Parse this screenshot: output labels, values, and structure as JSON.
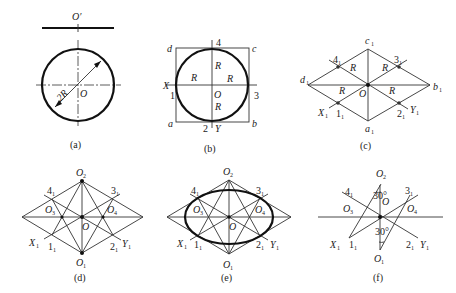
{
  "figure": {
    "panels": [
      {
        "id": "a",
        "caption": "(a)",
        "labels": {
          "top_point": "O′",
          "center": "O",
          "diameter": "2R"
        }
      },
      {
        "id": "b",
        "caption": "(b)",
        "labels": {
          "corners": [
            "a",
            "b",
            "c",
            "d"
          ],
          "points": [
            "1",
            "2",
            "3",
            "4"
          ],
          "axes": [
            "X",
            "Y"
          ],
          "center": "O",
          "radius": "R"
        }
      },
      {
        "id": "c",
        "caption": "(c)",
        "labels": {
          "corners": [
            "a₁",
            "b₁",
            "c₁",
            "d₁"
          ],
          "points": [
            "1₁",
            "2₁",
            "3₁",
            "4₁"
          ],
          "axes": [
            "X₁",
            "Y₁"
          ],
          "center": "O",
          "radius": "R"
        }
      },
      {
        "id": "d",
        "caption": "(d)",
        "labels": {
          "centers": [
            "O₁",
            "O₂",
            "O₃",
            "O₄"
          ],
          "points": [
            "1₁",
            "2₁",
            "3₁",
            "4₁"
          ],
          "axes": [
            "X₁",
            "Y₁"
          ],
          "center": "O"
        }
      },
      {
        "id": "e",
        "caption": "(e)",
        "labels": {
          "centers": [
            "O₁",
            "O₂",
            "O₃",
            "O₄"
          ],
          "points": [
            "1₁",
            "2₁",
            "3₁",
            "4₁"
          ],
          "axes": [
            "X₁",
            "Y₁"
          ],
          "center": "O"
        }
      },
      {
        "id": "f",
        "caption": "(f)",
        "labels": {
          "centers": [
            "O₁",
            "O₂",
            "O₃",
            "O₄"
          ],
          "points": [
            "1₁",
            "2₁",
            "3₁",
            "4₁"
          ],
          "axes": [
            "X₁",
            "Y₁"
          ],
          "center": "O",
          "angle": "30°"
        }
      }
    ]
  },
  "t": {
    "a_Op": "O′",
    "a_O": "O",
    "a_2R": "2R",
    "a_cap": "(a)",
    "b_a": "a",
    "b_b": "b",
    "b_c": "c",
    "b_d": "d",
    "b_1": "1",
    "b_2": "2",
    "b_3": "3",
    "b_4": "4",
    "b_X": "X",
    "b_Y": "Y",
    "b_O": "O",
    "b_R": "R",
    "b_cap": "(b)",
    "c_a": "a",
    "c_b": "b",
    "c_c": "c",
    "c_d": "d",
    "c_1": "1",
    "c_2": "2",
    "c_3": "3",
    "c_4": "4",
    "c_X": "X",
    "c_Y": "Y",
    "c_O": "O",
    "c_R": "R",
    "sub1": "1",
    "sub2": "2",
    "sub3": "3",
    "sub4": "4",
    "c_cap": "(c)",
    "O": "O",
    "d_cap": "(d)",
    "e_cap": "(e)",
    "f_cap": "(f)",
    "deg30": "30°"
  }
}
